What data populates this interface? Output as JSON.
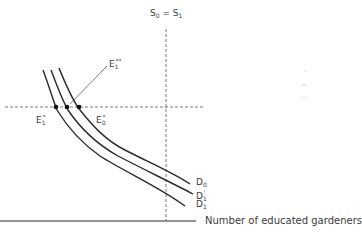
{
  "diagram": {
    "type": "economics-supply-demand",
    "supply_label": {
      "base": "S",
      "sub0": "0",
      "eq": " = ",
      "base2": "S",
      "sub1": "1"
    },
    "x_axis_label": "Number of educated gardeners",
    "demand_curves": [
      {
        "id": "D0",
        "base": "D",
        "sub": "0",
        "sup": ""
      },
      {
        "id": "D1prime",
        "base": "D",
        "sub": "1",
        "sup": "'"
      },
      {
        "id": "D1",
        "base": "D",
        "sub": "1",
        "sup": ""
      }
    ],
    "equilibria": [
      {
        "id": "E1star",
        "base": "E",
        "sub": "1",
        "sup": "*"
      },
      {
        "id": "E0star",
        "base": "E",
        "sub": "0",
        "sup": "*"
      },
      {
        "id": "E1doublestar",
        "base": "E",
        "sub": "1",
        "sup": "**"
      }
    ],
    "colors": {
      "line": "#2a2a2a",
      "dashed": "#555555",
      "text": "#3a3a3a"
    }
  }
}
